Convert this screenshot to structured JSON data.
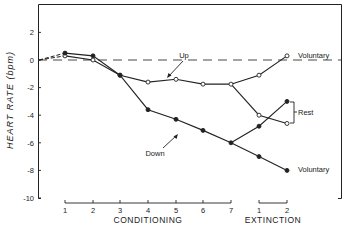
{
  "chart_data": {
    "type": "line",
    "title": "",
    "ylabel": "HEART RATE (bpm)",
    "xlabel_groups": [
      "CONDITIONING",
      "EXTINCTION"
    ],
    "ylim": [
      -10,
      3
    ],
    "yticks": [
      2,
      0,
      -2,
      -4,
      -6,
      -8,
      -10
    ],
    "ytick_labels": [
      "2",
      "0",
      "-2",
      "-4",
      "-6",
      "-8",
      "-10"
    ],
    "categories": [
      "C1",
      "C2",
      "C3",
      "C4",
      "C5",
      "C6",
      "C7",
      "E1",
      "E2"
    ],
    "xtick_labels": [
      "1",
      "2",
      "3",
      "4",
      "5",
      "6",
      "7",
      "1",
      "2"
    ],
    "grid": false,
    "reference_line": {
      "y": 0,
      "style": "dashed"
    },
    "series": [
      {
        "name": "Up",
        "marker": "open-circle",
        "phase": "conditioning",
        "x": [
          "C1",
          "C2",
          "C3",
          "C4",
          "C5",
          "C6",
          "C7"
        ],
        "values": [
          0.3,
          0.0,
          -1.1,
          -1.6,
          -1.4,
          -1.75,
          -1.75
        ]
      },
      {
        "name": "Down",
        "marker": "filled-circle",
        "phase": "conditioning",
        "x": [
          "C1",
          "C2",
          "C3",
          "C4",
          "C5",
          "C6",
          "C7"
        ],
        "values": [
          0.5,
          0.3,
          -1.1,
          -3.6,
          -4.3,
          -5.1,
          -6.0
        ]
      },
      {
        "name": "Up - Voluntary",
        "marker": "open-circle",
        "phase": "extinction",
        "x": [
          "C7",
          "E1",
          "E2"
        ],
        "values": [
          -1.75,
          -1.1,
          0.3
        ]
      },
      {
        "name": "Up - Rest",
        "marker": "open-circle",
        "phase": "extinction",
        "x": [
          "C7",
          "E1",
          "E2"
        ],
        "values": [
          -1.75,
          -4.0,
          -4.6
        ]
      },
      {
        "name": "Down - Rest",
        "marker": "filled-circle",
        "phase": "extinction",
        "x": [
          "C7",
          "E1",
          "E2"
        ],
        "values": [
          -6.0,
          -4.8,
          -3.0
        ]
      },
      {
        "name": "Down - Voluntary",
        "marker": "filled-circle",
        "phase": "extinction",
        "x": [
          "C7",
          "E1",
          "E2"
        ],
        "values": [
          -6.0,
          -7.0,
          -8.0
        ]
      }
    ],
    "annotations": [
      "Up",
      "Down",
      "Voluntary",
      "Rest",
      "Voluntary"
    ]
  },
  "labels": {
    "ylabel": "HEART RATE (bpm)",
    "conditioning": "CONDITIONING",
    "extinction": "EXTINCTION",
    "up": "Up",
    "down": "Down",
    "voluntary_top": "Voluntary",
    "rest": "Rest",
    "voluntary_bottom": "Voluntary"
  },
  "colors": {
    "ink": "#222222",
    "background": "#ffffff"
  }
}
